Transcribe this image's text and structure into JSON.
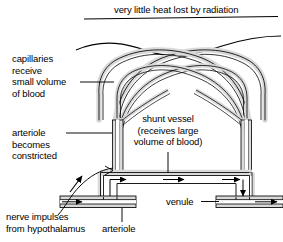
{
  "diagram": {
    "title_caption": "very little heat lost by radiation",
    "labels": {
      "capillaries": "capillaries\nreceive\nsmall volume\nof blood",
      "shunt_vessel": "shunt vessel\n(receives large\nvolume of blood)",
      "arteriole_constricted": "arteriole\nbecomes\nconstricted",
      "nerve_impulses": "nerve impulses\nfrom hypothalamus",
      "arteriole": "arteriole",
      "venule": "venule"
    },
    "colors": {
      "ink": "#000000",
      "vessel_wall_fill": "#d9d9d9",
      "lumen_fill": "#ffffff",
      "page_background": "#ffffff"
    },
    "icon_names": {
      "flow_arrow": "flow-arrow-icon",
      "nerve_arrow": "nerve-impulse-arrow-icon",
      "skin_surface": "skin-surface-line",
      "leader_line": "leader-line"
    }
  }
}
